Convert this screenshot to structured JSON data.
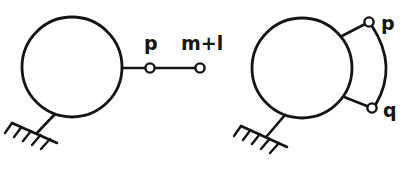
{
  "figure": {
    "background_color": "#ffffff",
    "ink_color": "#141414",
    "diagrams": [
      {
        "id": "left-diagram",
        "name": "single-link-chain",
        "body": {
          "name": "main-body-circle",
          "cx": 72,
          "cy": 67,
          "r": 50
        },
        "ground": {
          "name": "ground-support",
          "stem_from_x": 55,
          "stem_from_y": 114,
          "stem_to_x": 37,
          "stem_to_y": 133,
          "base_x1": 12,
          "base_y1": 123,
          "base_x2": 57,
          "base_y2": 143,
          "hatch_count": 5
        },
        "links": [
          {
            "name": "link-body-to-p",
            "x1": 121,
            "x2": 150,
            "y": 68
          },
          {
            "name": "link-p-to-m-plus-l",
            "x1": 150,
            "x2": 200,
            "y": 68
          }
        ],
        "joints": [
          {
            "name": "joint-p",
            "label": "p",
            "cx": 150,
            "cy": 68,
            "r": 4.6,
            "label_x": 144,
            "label_y": 50
          },
          {
            "name": "joint-m-plus-l",
            "label": "m+l",
            "cx": 200,
            "cy": 68,
            "r": 4.6,
            "label_x": 181,
            "label_y": 50
          }
        ]
      },
      {
        "id": "right-diagram",
        "name": "two-link-closed-chain",
        "body": {
          "name": "main-body-circle",
          "cx": 302,
          "cy": 68,
          "r": 50
        },
        "ground": {
          "name": "ground-support",
          "stem_from_x": 285,
          "stem_from_y": 115,
          "stem_to_x": 267,
          "stem_to_y": 136,
          "base_x1": 241,
          "base_y1": 126,
          "base_x2": 287,
          "base_y2": 147,
          "hatch_count": 5
        },
        "links": [
          {
            "name": "link-body-to-p",
            "x1": 340,
            "y1": 37,
            "x2": 369,
            "y2": 22
          },
          {
            "name": "link-body-to-q",
            "x1": 340,
            "y1": 96,
            "x2": 372,
            "y2": 108
          }
        ],
        "arc": {
          "name": "arc-link-p-to-q",
          "start_x": 372,
          "start_y": 26,
          "ctrl_x": 398,
          "ctrl_y": 66,
          "end_x": 376,
          "end_y": 104
        },
        "joints": [
          {
            "name": "joint-p",
            "label": "p",
            "cx": 369,
            "cy": 22,
            "r": 4.6,
            "label_x": 381,
            "label_y": 30
          },
          {
            "name": "joint-q",
            "label": "q",
            "cx": 372,
            "cy": 108,
            "r": 4.6,
            "label_x": 383,
            "label_y": 117
          }
        ]
      }
    ]
  }
}
